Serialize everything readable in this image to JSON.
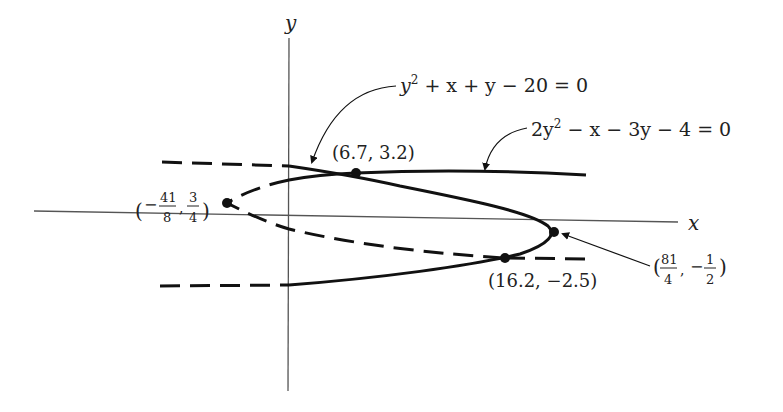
{
  "axes": {
    "x_label": "x",
    "y_label": "y"
  },
  "curves": [
    {
      "id": "ellipse-like",
      "equation": "y² + x + y − 20 = 0",
      "equation_parts": {
        "a": "y",
        "sup": "2",
        "rest": " + x + y − 20 = 0"
      },
      "style": "solid-where-in-region, dashed-elsewhere"
    },
    {
      "id": "parabola",
      "equation": "2y² − x − 3y − 4 = 0",
      "equation_parts": {
        "a": "2y",
        "sup": "2",
        "rest": " − x − 3y − 4 = 0"
      },
      "style": "solid-where-in-region, dashed-elsewhere"
    }
  ],
  "points": [
    {
      "label": "(6.7, 3.2)",
      "x": 6.7,
      "y": 3.2,
      "kind": "intersection"
    },
    {
      "label": "(16.2, −2.5)",
      "x": 16.2,
      "y": -2.5,
      "kind": "intersection"
    },
    {
      "label_num_x": "41",
      "label_den_x": "8",
      "label_num_y": "3",
      "label_den_y": "4",
      "label": "(−41/8, 3/4)",
      "x": -5.125,
      "y": 0.75,
      "kind": "vertex"
    },
    {
      "label_num_x": "81",
      "label_den_x": "4",
      "label_num_y": "1",
      "label_den_y": "2",
      "label": "(81/4, −1/2)",
      "x": 20.25,
      "y": -0.5,
      "kind": "vertex"
    }
  ],
  "text": {
    "open_paren": "(",
    "close_paren": ")",
    "comma": ",",
    "minus": "−",
    "pt1": "(6.7, 3.2)",
    "pt2": "(16.2, −2.5)"
  }
}
